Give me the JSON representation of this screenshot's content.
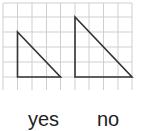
{
  "grid": {
    "x_lines": [
      3,
      17.5,
      32,
      46.5,
      60.5,
      75,
      89,
      103.5,
      118,
      132
    ],
    "y_lines": [
      3,
      17,
      32,
      47,
      62,
      77
    ],
    "y_bottom": 90,
    "line_color": "#cfcfcf"
  },
  "shapes": [
    {
      "name": "small-triangle",
      "points": [
        [
          17.5,
          32
        ],
        [
          17.5,
          77
        ],
        [
          60.5,
          77
        ]
      ]
    },
    {
      "name": "large-triangle",
      "points": [
        [
          75,
          17
        ],
        [
          75,
          77
        ],
        [
          132,
          77
        ]
      ]
    }
  ],
  "stroke_color": "#333333",
  "labels": {
    "yes": "yes",
    "no": "no"
  }
}
